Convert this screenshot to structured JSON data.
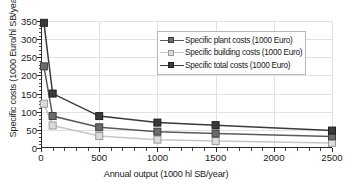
{
  "chart_data": {
    "type": "line",
    "title": "",
    "xlabel": "Annual output (1000 hl SB/year)",
    "ylabel": "Specific costs (1000 Euro/hl SB/year)",
    "x": [
      25,
      100,
      500,
      1000,
      1500,
      2500
    ],
    "xlim": [
      0,
      2500
    ],
    "ylim": [
      0,
      350
    ],
    "xticks": [
      0,
      500,
      1000,
      1500,
      2000,
      2500
    ],
    "xtick_labels": [
      "0",
      "500",
      "1000",
      "1500",
      "2000",
      "2500"
    ],
    "yticks": [
      0,
      50,
      100,
      150,
      200,
      250,
      300,
      350
    ],
    "ytick_labels": [
      "0",
      "50",
      "100",
      "150",
      "200",
      "250",
      "300",
      "350"
    ],
    "x_minor_interval": 100,
    "y_minor_interval": 10,
    "grid": true,
    "legend_position": "upper-right-inside",
    "series": [
      {
        "name": "Specific plant costs (1000 Euro)",
        "values": [
          225,
          88,
          57,
          45,
          40,
          32
        ],
        "color": "#6b6b6b",
        "marker": "square",
        "marker_fill": "#6b6b6b",
        "marker_edge": "#3d3d3d",
        "line_color": "#5a5a5a"
      },
      {
        "name": "Specific building costs (1000 Euro)",
        "values": [
          122,
          62,
          33,
          23,
          19,
          14
        ],
        "color": "#d2d2d2",
        "marker": "square",
        "marker_fill": "#dcdcdc",
        "marker_edge": "#9a9a9a",
        "line_color": "#c6c6c6"
      },
      {
        "name": "Specific total costs (1000 Euro)",
        "values": [
          345,
          150,
          88,
          70,
          63,
          48
        ],
        "color": "#3a3a3a",
        "marker": "square",
        "marker_fill": "#3a3a3a",
        "marker_edge": "#202020",
        "line_color": "#3a3a3a"
      }
    ]
  },
  "axes": {
    "x_title": "Annual output (1000 hl SB/year)",
    "y_title": "Specific costs (1000 Euro/hl SB/year)"
  },
  "legend": {
    "items": [
      {
        "label": "Specific plant costs (1000 Euro)"
      },
      {
        "label": "Specific building costs (1000 Euro)"
      },
      {
        "label": "Specific total costs (1000 Euro)"
      }
    ]
  },
  "colors": {
    "axis": "#2a2a2a",
    "grid": "#e2e2e2",
    "legend_border": "#b8b8b8",
    "legend_background": "#fdfdfd",
    "plot_background": "#ffffff"
  }
}
